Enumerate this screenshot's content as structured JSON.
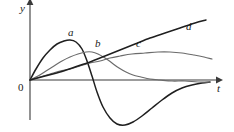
{
  "figure": {
    "background_color": "#ffffff",
    "width": 234,
    "height": 132
  },
  "axes": {
    "y_axis_label": "y",
    "x_axis_label": "t",
    "origin_label": "0",
    "axis_color": "#3a3a3a",
    "origin_px": {
      "x": 30,
      "y": 80
    },
    "x_axis_end_px": {
      "x": 216,
      "y": 80
    },
    "y_axis_end_px": {
      "x": 30,
      "y": 5
    }
  },
  "chart_data": {
    "type": "line",
    "title": "",
    "subtitle": "",
    "xlabel": "t",
    "ylabel": "y",
    "xlim": [
      0,
      190
    ],
    "ylim": [
      -48,
      78
    ],
    "grid": false,
    "legend_position": "inline-curve-labels",
    "annotations": [
      "a",
      "b",
      "c",
      "d"
    ],
    "series": [
      {
        "name": "a",
        "color": "#1f1f1f",
        "width": 1.5,
        "label_px": {
          "x": 68,
          "y": 27
        },
        "points_px": [
          [
            30,
            80
          ],
          [
            36,
            69
          ],
          [
            43,
            58
          ],
          [
            50,
            50
          ],
          [
            57,
            44
          ],
          [
            64,
            41
          ],
          [
            70,
            40
          ],
          [
            76,
            42
          ],
          [
            82,
            49
          ],
          [
            87,
            61
          ],
          [
            92,
            76
          ],
          [
            97,
            92
          ],
          [
            103,
            107
          ],
          [
            110,
            118
          ],
          [
            117,
            124
          ],
          [
            125,
            125
          ],
          [
            133,
            122
          ],
          [
            142,
            116
          ],
          [
            152,
            108
          ],
          [
            162,
            100
          ],
          [
            172,
            93
          ],
          [
            182,
            88
          ],
          [
            192,
            85
          ],
          [
            202,
            83
          ],
          [
            210,
            82
          ]
        ]
      },
      {
        "name": "b",
        "color": "#6b6b6b",
        "width": 1.2,
        "label_px": {
          "x": 95,
          "y": 38
        },
        "points_px": [
          [
            30,
            80
          ],
          [
            38,
            76
          ],
          [
            46,
            71
          ],
          [
            54,
            66
          ],
          [
            62,
            61
          ],
          [
            70,
            57
          ],
          [
            78,
            54
          ],
          [
            86,
            52
          ],
          [
            92,
            52
          ],
          [
            98,
            54
          ],
          [
            105,
            58
          ],
          [
            112,
            63
          ],
          [
            119,
            68
          ],
          [
            126,
            72
          ],
          [
            133,
            75
          ],
          [
            141,
            77
          ],
          [
            150,
            79
          ],
          [
            160,
            80
          ],
          [
            172,
            81
          ],
          [
            185,
            81
          ],
          [
            198,
            82
          ],
          [
            210,
            82
          ]
        ]
      },
      {
        "name": "c",
        "color": "#6b6b6b",
        "width": 1.2,
        "label_px": {
          "x": 136,
          "y": 38
        },
        "points_px": [
          [
            30,
            80
          ],
          [
            40,
            77
          ],
          [
            50,
            74
          ],
          [
            60,
            71
          ],
          [
            70,
            69
          ],
          [
            80,
            66
          ],
          [
            90,
            63
          ],
          [
            100,
            61
          ],
          [
            110,
            58
          ],
          [
            120,
            56
          ],
          [
            132,
            54
          ],
          [
            145,
            53
          ],
          [
            158,
            52
          ],
          [
            170,
            52
          ],
          [
            182,
            53
          ],
          [
            194,
            55
          ],
          [
            204,
            57
          ],
          [
            212,
            59
          ]
        ]
      },
      {
        "name": "d",
        "color": "#1f1f1f",
        "width": 1.5,
        "label_px": {
          "x": 186,
          "y": 21
        },
        "points_px": [
          [
            30,
            80
          ],
          [
            45,
            76
          ],
          [
            60,
            72
          ],
          [
            75,
            67
          ],
          [
            90,
            62
          ],
          [
            105,
            56
          ],
          [
            120,
            50
          ],
          [
            135,
            44
          ],
          [
            150,
            38
          ],
          [
            165,
            33
          ],
          [
            180,
            28
          ],
          [
            195,
            23
          ],
          [
            206,
            20
          ]
        ]
      }
    ]
  }
}
